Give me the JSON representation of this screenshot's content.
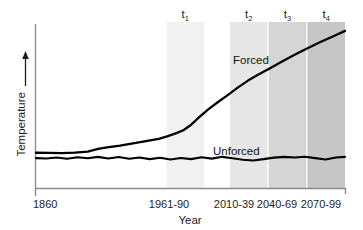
{
  "chart_data": {
    "type": "line",
    "title": "",
    "xlabel": "Year",
    "ylabel": "Temperature",
    "ylabel_arrow": "↑",
    "grid": false,
    "legend": "inline-labels",
    "x_tick_labels": [
      "1860",
      "1961-90",
      "2010-39",
      "2040-69",
      "2070-99"
    ],
    "y_tick_labels": [],
    "xlim": [
      1860,
      2099
    ],
    "ylim": [
      0,
      1
    ],
    "axis_note": "y-axis unlabeled / relative temperature, arrow indicates increasing",
    "series": [
      {
        "name": "Forced",
        "label": "Forced",
        "color": "#000000",
        "points": [
          [
            1860,
            0.215
          ],
          [
            1870,
            0.214
          ],
          [
            1880,
            0.213
          ],
          [
            1890,
            0.216
          ],
          [
            1900,
            0.222
          ],
          [
            1908,
            0.239
          ],
          [
            1915,
            0.248
          ],
          [
            1925,
            0.258
          ],
          [
            1935,
            0.272
          ],
          [
            1945,
            0.286
          ],
          [
            1955,
            0.3
          ],
          [
            1962,
            0.316
          ],
          [
            1968,
            0.333
          ],
          [
            1974,
            0.352
          ],
          [
            1980,
            0.386
          ],
          [
            1986,
            0.43
          ],
          [
            1993,
            0.478
          ],
          [
            2000,
            0.52
          ],
          [
            2008,
            0.565
          ],
          [
            2016,
            0.612
          ],
          [
            2024,
            0.655
          ],
          [
            2032,
            0.692
          ],
          [
            2040,
            0.726
          ],
          [
            2050,
            0.77
          ],
          [
            2060,
            0.812
          ],
          [
            2070,
            0.852
          ],
          [
            2080,
            0.89
          ],
          [
            2090,
            0.925
          ],
          [
            2099,
            0.958
          ]
        ]
      },
      {
        "name": "Unforced",
        "label": "Unforced",
        "color": "#000000",
        "points": [
          [
            1860,
            0.182
          ],
          [
            1868,
            0.18
          ],
          [
            1876,
            0.186
          ],
          [
            1884,
            0.178
          ],
          [
            1892,
            0.188
          ],
          [
            1900,
            0.181
          ],
          [
            1908,
            0.19
          ],
          [
            1916,
            0.18
          ],
          [
            1924,
            0.189
          ],
          [
            1932,
            0.178
          ],
          [
            1940,
            0.186
          ],
          [
            1948,
            0.176
          ],
          [
            1956,
            0.184
          ],
          [
            1964,
            0.174
          ],
          [
            1972,
            0.183
          ],
          [
            1980,
            0.176
          ],
          [
            1988,
            0.188
          ],
          [
            1996,
            0.179
          ],
          [
            2004,
            0.19
          ],
          [
            2012,
            0.181
          ],
          [
            2020,
            0.172
          ],
          [
            2028,
            0.168
          ],
          [
            2036,
            0.176
          ],
          [
            2044,
            0.185
          ],
          [
            2052,
            0.19
          ],
          [
            2060,
            0.186
          ],
          [
            2068,
            0.191
          ],
          [
            2076,
            0.182
          ],
          [
            2084,
            0.174
          ],
          [
            2092,
            0.186
          ],
          [
            2099,
            0.19
          ]
        ]
      }
    ],
    "periods": [
      {
        "label": "t",
        "sub": "1",
        "range_label": "1961-90",
        "start": 1961,
        "end": 1990,
        "shade": "#f1f1f1"
      },
      {
        "label": "t",
        "sub": "2",
        "range_label": "2010-39",
        "start": 2010,
        "end": 2039,
        "shade": "#e6e6e6"
      },
      {
        "label": "t",
        "sub": "3",
        "range_label": "2040-69",
        "start": 2040,
        "end": 2069,
        "shade": "#d5d5d5"
      },
      {
        "label": "t",
        "sub": "4",
        "range_label": "2070-99",
        "start": 2070,
        "end": 2099,
        "shade": "#c6c6c6"
      }
    ],
    "colors": {
      "background": "#ffffff",
      "axis": "#8c8c8c",
      "curve": "#000000",
      "text": "#1d1d1d"
    }
  }
}
